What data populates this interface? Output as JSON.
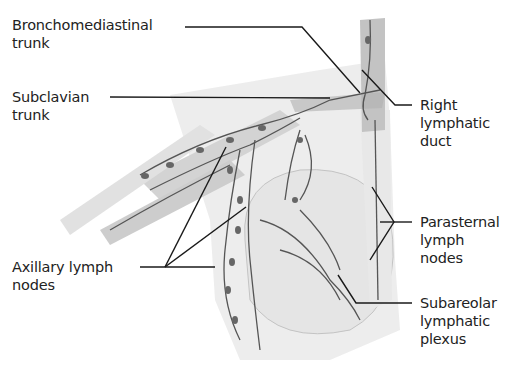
{
  "figure": {
    "labels": {
      "bronchomediastinal": "Bronchomediastinal\ntrunk",
      "subclavian": "Subclavian\ntrunk",
      "right_lymphatic_duct": "Right\nlymphatic\nduct",
      "parasternal": "Parasternal\nlymph\nnodes",
      "axillary": "Axillary lymph\nnodes",
      "subareolar": "Subareolar\nlymphatic\nplexus"
    },
    "colors": {
      "background": "#ffffff",
      "label_text": "#222222",
      "leader_line": "#1a1a1a",
      "lymph_vessel": "#555555",
      "tissue": "#d9d9d9"
    }
  }
}
